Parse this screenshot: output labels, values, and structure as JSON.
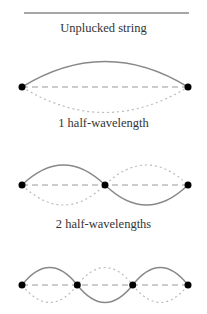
{
  "colors": {
    "string": "#888888",
    "dashed_axis": "#999999",
    "dotted_alt": "#bbbbbb",
    "node": "#000000",
    "text": "#333333"
  },
  "panels": [
    {
      "id": "unplucked",
      "label": "Unplucked string",
      "half_wavelengths": 0
    },
    {
      "id": "mode1",
      "label": "1 half-wavelength",
      "half_wavelengths": 1,
      "nodes": 2
    },
    {
      "id": "mode2",
      "label": "2 half-wavelengths",
      "half_wavelengths": 2,
      "nodes": 3
    },
    {
      "id": "mode3",
      "label": "",
      "half_wavelengths": 3,
      "nodes": 4
    }
  ]
}
